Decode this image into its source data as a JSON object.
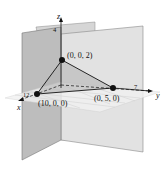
{
  "diagram": {
    "type": "3d-coordinate-plot",
    "axes": {
      "x": {
        "label": "x",
        "tick": "12"
      },
      "y": {
        "label": "y",
        "tick": "7"
      },
      "z": {
        "label": "z",
        "tick": "4"
      }
    },
    "points": [
      {
        "label": "(0, 0, 2)",
        "coords": [
          0,
          0,
          2
        ]
      },
      {
        "label": "(10, 0, 0)",
        "coords": [
          10,
          0,
          0
        ]
      },
      {
        "label": "(0, 5, 0)",
        "coords": [
          0,
          5,
          0
        ]
      }
    ],
    "colors": {
      "plane": "#d9d9d9",
      "plane_dark": "#bfbfbf",
      "triangle": "#b8b8b8",
      "line": "#111111"
    }
  }
}
